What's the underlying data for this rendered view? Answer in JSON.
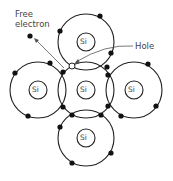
{
  "diagram": {
    "title": "",
    "labels": {
      "free_electron_line1": "Free",
      "free_electron_line2": "electron",
      "hole": "Hole"
    },
    "atoms": [
      {
        "id": "top",
        "label": "Si"
      },
      {
        "id": "left",
        "label": "Si"
      },
      {
        "id": "center",
        "label": "Si"
      },
      {
        "id": "right",
        "label": "Si"
      },
      {
        "id": "bottom",
        "label": "Si"
      }
    ],
    "colors": {
      "line": "#222222",
      "electron": "#111111",
      "label": "#444444",
      "background": "#ffffff"
    }
  }
}
